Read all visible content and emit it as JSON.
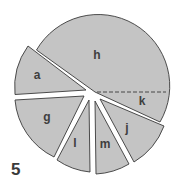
{
  "figure": {
    "number": "5",
    "type": "exploded pie diagram",
    "fill_color": "#c4c4c4",
    "stroke_color": "#3a3a3a",
    "sectors": [
      {
        "label": "h"
      },
      {
        "label": "k"
      },
      {
        "label": "a"
      },
      {
        "label": "g"
      },
      {
        "label": "l"
      },
      {
        "label": "m"
      },
      {
        "label": "j"
      }
    ]
  }
}
